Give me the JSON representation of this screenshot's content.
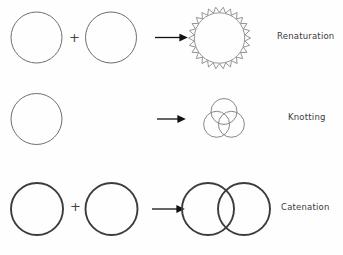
{
  "figure": {
    "background_color": "#fefefe",
    "thin_stroke_color": "#6e6e6e",
    "thick_stroke_color": "#3c3c3c",
    "arrow_color": "#111111",
    "label_color": "#3a3a3a",
    "cropped_top_text": ""
  },
  "rows": [
    {
      "id": "renaturation",
      "label": "Renaturation",
      "operator": "+",
      "inputs": [
        {
          "name": "single-stranded-circle-left",
          "shape": "circle",
          "cx": 36.5,
          "cy": 37.5,
          "r": 25.5,
          "stroke": "#6e6e6e",
          "stroke_width": 1
        },
        {
          "name": "single-stranded-circle-right",
          "shape": "circle",
          "cx": 111.0,
          "cy": 37.5,
          "r": 25.5,
          "stroke": "#6e6e6e",
          "stroke_width": 1
        }
      ],
      "arrow": {
        "x1": 155,
        "y1": 37.5,
        "x2": 183,
        "y2": 37.5
      },
      "product": {
        "name": "double-stranded-wavy-circle",
        "shape": "zigzag-ring",
        "cx": 219.5,
        "cy": 38.0,
        "r_inner": 25.0,
        "r_outer": 31.0,
        "teeth": 26,
        "stroke": "#8a8a8a",
        "stroke_width": 0.9
      }
    },
    {
      "id": "knotting",
      "label": "Knotting",
      "operator": "",
      "inputs": [
        {
          "name": "single-circle",
          "shape": "circle",
          "cx": 36.5,
          "cy": 119.0,
          "r": 25.5,
          "stroke": "#6e6e6e",
          "stroke_width": 1
        }
      ],
      "arrow": {
        "x1": 157,
        "y1": 119.0,
        "x2": 181,
        "y2": 119.0
      },
      "product": {
        "name": "trefoil-knot",
        "shape": "three-overlapping-circles",
        "cx": 224.0,
        "cy": 120.0,
        "circle_r": 13.0,
        "offset_r": 8.5,
        "stroke": "#7a7a7a",
        "stroke_width": 0.9
      }
    },
    {
      "id": "catenation",
      "label": "Catenation",
      "operator": "+",
      "inputs": [
        {
          "name": "closed-circle-left",
          "shape": "circle",
          "cx": 37.0,
          "cy": 209.0,
          "r": 26.0,
          "stroke": "#3c3c3c",
          "stroke_width": 1.9
        },
        {
          "name": "closed-circle-right",
          "shape": "circle",
          "cx": 111.5,
          "cy": 209.0,
          "r": 26.0,
          "stroke": "#3c3c3c",
          "stroke_width": 1.9
        }
      ],
      "arrow": {
        "x1": 152,
        "y1": 209.0,
        "x2": 180,
        "y2": 209.0
      },
      "product": {
        "name": "catenane-interlocked-circles",
        "shape": "two-interlocked-circles",
        "left": {
          "cx": 208.0,
          "cy": 209.0,
          "r": 26.0
        },
        "right": {
          "cx": 244.0,
          "cy": 209.0,
          "r": 26.0
        },
        "stroke": "#3c3c3c",
        "stroke_width": 1.9
      }
    }
  ]
}
